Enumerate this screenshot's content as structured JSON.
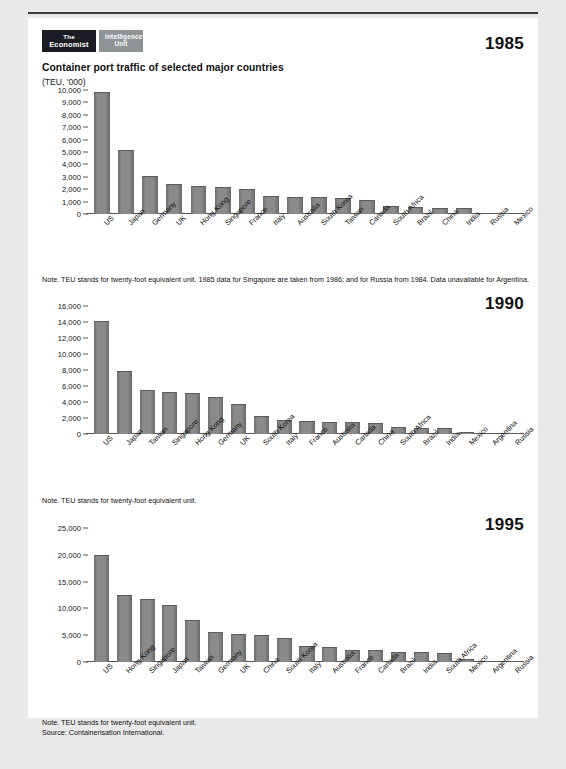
{
  "brand": {
    "primary_line1": "The",
    "primary_line2": "Economist",
    "secondary_line1": "Intelligence",
    "secondary_line2": "Unit"
  },
  "header": {
    "title": "Container port traffic of selected major countries",
    "subtitle": "(TEU, '000)"
  },
  "colors": {
    "bar": "#858585",
    "axis": "#555555",
    "text": "#111111",
    "sheet": "#ffffff",
    "page": "#e9e9e9",
    "logo_dark": "#1c1c24",
    "logo_grey": "#8e9396"
  },
  "notes": {
    "chart1": "Note. TEU stands for twenty-foot equivalent unit. 1985 data for Singapore are taken from 1986; and for Russia from 1984. Data unavailable for Argentina.",
    "chart2": "Note. TEU stands for twenty-foot equivalent unit.",
    "chart3_line1": "Note. TEU stands for twenty-foot equivalent unit.",
    "chart3_line2": "Source: Containerisation International."
  },
  "chart_data": [
    {
      "type": "bar",
      "title": "1985",
      "xlabel": "",
      "ylabel": "TEU, '000",
      "ylim": [
        0,
        10000
      ],
      "yticks": [
        0,
        1000,
        2000,
        3000,
        4000,
        5000,
        6000,
        7000,
        8000,
        9000,
        10000
      ],
      "ytick_labels": [
        "0",
        "1,000",
        "2,000",
        "3,000",
        "4,000",
        "5,000",
        "6,000",
        "7,000",
        "8,000",
        "9,000",
        "10,000"
      ],
      "grid": false,
      "legend": "none",
      "categories": [
        "US",
        "Japan",
        "Germany",
        "UK",
        "Hong Kong",
        "Singapore",
        "France",
        "Italy",
        "Australia",
        "South Korea",
        "Taiwan",
        "Canada",
        "South Africa",
        "Brazil",
        "China",
        "India",
        "Russia",
        "Mexico"
      ],
      "values": [
        9880,
        5150,
        3100,
        2450,
        2270,
        2160,
        2010,
        1440,
        1370,
        1360,
        1260,
        1170,
        670,
        560,
        520,
        480,
        70,
        40
      ]
    },
    {
      "type": "bar",
      "title": "1990",
      "xlabel": "",
      "ylabel": "TEU, '000",
      "ylim": [
        0,
        16000
      ],
      "yticks": [
        0,
        2000,
        4000,
        6000,
        8000,
        10000,
        12000,
        14000,
        16000
      ],
      "ytick_labels": [
        "0",
        "2,000",
        "4,000",
        "6,000",
        "8,000",
        "10,000",
        "12,000",
        "14,000",
        "16,000"
      ],
      "grid": false,
      "legend": "none",
      "categories": [
        "US",
        "Japan",
        "Taiwan",
        "Singapore",
        "Hong Kong",
        "Germany",
        "UK",
        "South Korea",
        "Italy",
        "France",
        "Australia",
        "Canada",
        "China",
        "South Africa",
        "Brazil",
        "India",
        "Mexico",
        "Argentina",
        "Russia"
      ],
      "values": [
        14150,
        7900,
        5450,
        5250,
        5100,
        4620,
        3760,
        2280,
        1720,
        1620,
        1560,
        1540,
        1380,
        830,
        750,
        700,
        220,
        130,
        60
      ]
    },
    {
      "type": "bar",
      "title": "1995",
      "xlabel": "",
      "ylabel": "TEU, '000",
      "ylim": [
        0,
        25000
      ],
      "yticks": [
        0,
        5000,
        10000,
        15000,
        20000,
        25000
      ],
      "ytick_labels": [
        "0",
        "5,000",
        "10,000",
        "15,000",
        "20,000",
        "25,000"
      ],
      "grid": false,
      "legend": "none",
      "categories": [
        "US",
        "Hong Kong",
        "Singapore",
        "Japan",
        "Taiwan",
        "Germany",
        "UK",
        "China",
        "South Korea",
        "Italy",
        "Australia",
        "France",
        "Canada",
        "Brazil",
        "India",
        "South Africa",
        "Mexico",
        "Argentina",
        "Russia"
      ],
      "values": [
        20050,
        12500,
        11800,
        10600,
        7800,
        5550,
        5300,
        4950,
        4400,
        2950,
        2750,
        2300,
        2150,
        1950,
        1800,
        1750,
        650,
        180,
        90
      ]
    }
  ]
}
